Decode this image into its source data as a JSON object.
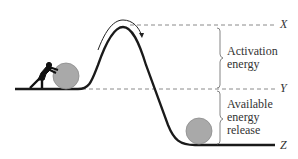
{
  "diagram": {
    "levels": [
      {
        "id": "X",
        "label": "X"
      },
      {
        "id": "Y",
        "label": "Y"
      },
      {
        "id": "Z",
        "label": "Z"
      }
    ],
    "braces": [
      {
        "id": "activation",
        "line1": "Activation",
        "line2": "energy"
      },
      {
        "id": "release",
        "line1": "Available",
        "line2": "energy",
        "line3": "release"
      }
    ],
    "figures": [
      "person-pushing-boulder",
      "boulder-at-top-start",
      "boulder-at-bottom",
      "curved-arrow-over-peak"
    ],
    "colors": {
      "line": "#1a1a1a",
      "dash": "#888888",
      "boulder": "#a8a8a8",
      "text": "#333333"
    }
  }
}
